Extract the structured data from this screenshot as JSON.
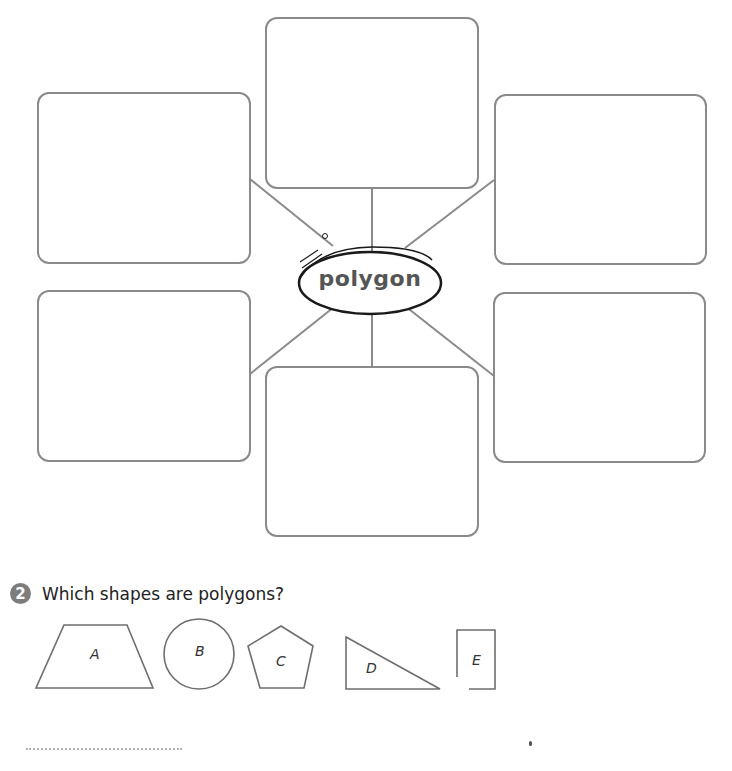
{
  "mind_map": {
    "center_word": "polygon",
    "boxes": [
      {
        "id": "top",
        "text": ""
      },
      {
        "id": "left-top",
        "text": ""
      },
      {
        "id": "right-top",
        "text": ""
      },
      {
        "id": "left-bottom",
        "text": ""
      },
      {
        "id": "right-bottom",
        "text": ""
      },
      {
        "id": "bottom",
        "text": ""
      }
    ]
  },
  "question": {
    "number": "2",
    "text": "Which shapes are polygons?",
    "shapes": [
      {
        "label": "A",
        "type": "trapezoid"
      },
      {
        "label": "B",
        "type": "circle"
      },
      {
        "label": "C",
        "type": "pentagon"
      },
      {
        "label": "D",
        "type": "right-triangle"
      },
      {
        "label": "E",
        "type": "open-rectangle"
      }
    ],
    "answer": ""
  },
  "colors": {
    "line": "#8a8a8a",
    "badge": "#7d7d7d",
    "ellipse": "#1a1a1a"
  }
}
